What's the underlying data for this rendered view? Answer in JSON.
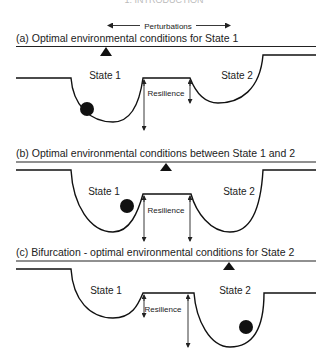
{
  "header": {
    "text": "1. INTRODUCTION"
  },
  "perturbations": {
    "label": "Perturbations"
  },
  "panels": [
    {
      "id": "a",
      "title": "(a) Optimal environmental conditions for State 1",
      "state1_label": "State 1",
      "state2_label": "State 2",
      "resilience_label": "Resilience",
      "ball_position": "State 1 basin (left wall)",
      "marker_position": "over State 1"
    },
    {
      "id": "b",
      "title": "(b) Optimal environmental conditions between State 1 and 2",
      "state1_label": "State 1",
      "state2_label": "State 2",
      "resilience_label": "Resilience",
      "ball_position": "State 1 basin (right wall)",
      "marker_position": "between State 1 and State 2"
    },
    {
      "id": "c",
      "title": "(c) Bifurcation - optimal environmental conditions for State 2",
      "state1_label": "State 1",
      "state2_label": "State 2",
      "resilience_label": "Resilience",
      "ball_position": "State 2 basin (right wall)",
      "marker_position": "over State 2"
    }
  ],
  "colors": {
    "ink": "#111111",
    "background": "#ffffff"
  }
}
